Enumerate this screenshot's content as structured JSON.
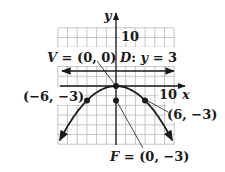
{
  "diagram": {
    "type": "parabola-graph",
    "equation_hint": "x^2 = -12y",
    "axes": {
      "x_label": "x",
      "y_label": "y",
      "x_tick_label": "10",
      "y_tick_label": "10",
      "x_range": [
        -12,
        12
      ],
      "y_range": [
        -12,
        12
      ],
      "grid_step": 2
    },
    "labels": {
      "vertex": "V = (0, 0)",
      "directrix": "D: y = 3",
      "left_point": "(−6, −3)",
      "right_point": "(6, −3)",
      "focus": "F = (0, −3)"
    },
    "points": [
      {
        "name": "vertex",
        "x": 0,
        "y": 0
      },
      {
        "name": "focus",
        "x": 0,
        "y": -3
      },
      {
        "name": "left-point",
        "x": -6,
        "y": -3
      },
      {
        "name": "right-point",
        "x": 6,
        "y": -3
      }
    ],
    "directrix_y": 3,
    "colors": {
      "ink": "#1a1a1a",
      "grid": "#b8b8b8",
      "background": "#ffffff"
    }
  }
}
